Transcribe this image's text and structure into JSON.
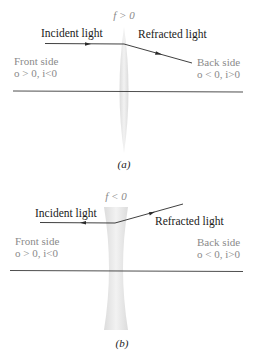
{
  "panel_a": {
    "focal_label": "f > 0",
    "incident_label": "Incident light",
    "refracted_label": "Refracted light",
    "front_side_label": "Front side",
    "front_side_signs": "o > 0, i<0",
    "back_side_label": "Back side",
    "back_side_signs": "o < 0, i>0",
    "caption": "(a)",
    "lens_type": "converging"
  },
  "panel_b": {
    "focal_label": "f < 0",
    "incident_label": "Incident light",
    "refracted_label": "Refracted light",
    "front_side_label": "Front side",
    "front_side_signs": "o > 0, i<0",
    "back_side_label": "Back side",
    "back_side_signs": "o < 0, i>0",
    "caption": "(b)",
    "lens_type": "diverging"
  },
  "colors": {
    "ray": "#2a2a2a",
    "axis": "#3a3a3a",
    "lens_fill": "#e6e6e6",
    "side_text": "#8a8a8a",
    "ray_text": "#1a1a1a"
  }
}
